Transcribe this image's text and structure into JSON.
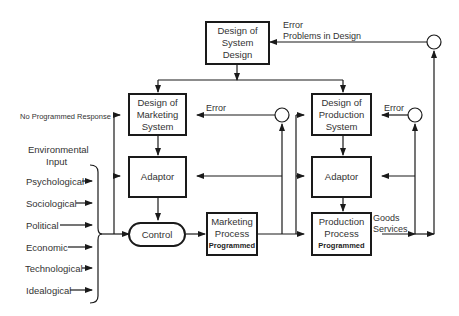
{
  "boxes": {
    "system_design": {
      "line1": "Design of",
      "line2": "System",
      "line3": "Design"
    },
    "marketing_design": {
      "line1": "Design of",
      "line2": "Marketing",
      "line3": "System"
    },
    "production_design": {
      "line1": "Design of",
      "line2": "Production",
      "line3": "System"
    },
    "adaptor_marketing": {
      "label": "Adaptor"
    },
    "adaptor_production": {
      "label": "Adaptor"
    },
    "control": {
      "label": "Control"
    },
    "marketing_process": {
      "line1": "Marketing",
      "line2": "Process",
      "line3": "Programmed"
    },
    "production_process": {
      "line1": "Production",
      "line2": "Process",
      "line3": "Programmed"
    }
  },
  "labels": {
    "error_top_1": "Error",
    "error_top_2": "Problems in Design",
    "error_marketing": "Error",
    "error_production": "Error",
    "no_programmed_response": "No Programmed Response",
    "env_input_1": "Environmental",
    "env_input_2": "Input",
    "goods": "Goods",
    "services": "Services"
  },
  "environmental_inputs": [
    "Psychological",
    "Sociological",
    "Political",
    "Economic",
    "Technological",
    "Idealogical"
  ]
}
